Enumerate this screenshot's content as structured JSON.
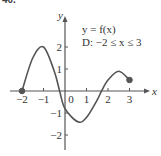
{
  "figure": {
    "number_label": "40."
  },
  "chart_data": {
    "type": "line",
    "title": "",
    "xlabel": "x",
    "ylabel": "y",
    "annotations": [
      "y = f(x)",
      "D: −2 ≤ x ≤ 3"
    ],
    "xlim": [
      -2.2,
      3.5
    ],
    "ylim": [
      -2.6,
      3.2
    ],
    "x_ticks": [
      -2,
      -1,
      0,
      1,
      2,
      3
    ],
    "x_tick_labels": [
      "−2",
      "−1",
      "0",
      "1",
      "2",
      "3"
    ],
    "y_ticks": [
      -2,
      -1,
      1,
      2
    ],
    "y_tick_labels": [
      "−2",
      "−1",
      "1",
      "2"
    ],
    "grid": false,
    "legend": null,
    "series": [
      {
        "name": "f(x)",
        "color": "#555555",
        "x": [
          -2,
          -1.5,
          -1,
          -0.5,
          -0.25,
          0,
          0.6,
          1,
          1.5,
          1.7,
          2,
          2.5,
          3
        ],
        "y": [
          0,
          1.5,
          2,
          0.9,
          0,
          -0.8,
          -1.4,
          -1.2,
          -0.4,
          0,
          0.5,
          0.9,
          0.5
        ]
      }
    ],
    "endpoints": [
      {
        "x": -2,
        "y": 0,
        "filled": true
      },
      {
        "x": 3,
        "y": 0.5,
        "filled": true
      }
    ]
  }
}
